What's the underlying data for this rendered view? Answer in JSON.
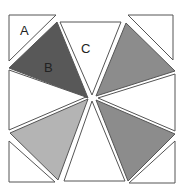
{
  "diagram": {
    "labels": {
      "a": "A",
      "b": "B",
      "c": "C"
    },
    "colors": {
      "stroke": "#555555",
      "white": "#ffffff",
      "dark_gray": "#585858",
      "medium_gray": "#8c8c8c",
      "light_gray": "#b4b4b4"
    },
    "shapes": [
      {
        "id": "corner-top-left",
        "label": "A",
        "fill": "white",
        "points": "9,15 56,15 9,61"
      },
      {
        "id": "pinwheel-dark",
        "label": "B",
        "fill": "dark_gray",
        "points": "57,22 9,68 88,98"
      },
      {
        "id": "pinwheel-top-white",
        "label": "C",
        "fill": "white",
        "points": "60,22 121,22 92,95"
      },
      {
        "id": "pinwheel-top-right",
        "fill": "medium_gray",
        "points": "126,23 175,71 96,96"
      },
      {
        "id": "pinwheel-right-white",
        "fill": "white",
        "points": "175,74 175,131 98,98"
      },
      {
        "id": "pinwheel-lower-right",
        "fill": "medium_gray",
        "points": "175,134 128,181 96,100"
      },
      {
        "id": "pinwheel-bottom-white",
        "fill": "white",
        "points": "64,181 125,181 92,101"
      },
      {
        "id": "pinwheel-lower-left",
        "fill": "light_gray",
        "points": "10,133 88,99 58,180"
      },
      {
        "id": "pinwheel-left-white",
        "fill": "white",
        "points": "9,70 9,130 86,97"
      },
      {
        "id": "corner-top-right",
        "fill": "white",
        "points": "128,15 173,15 173,60"
      },
      {
        "id": "corner-bottom-left",
        "fill": "white",
        "points": "9,141 9,182 55,182"
      },
      {
        "id": "corner-bottom-right",
        "fill": "white",
        "points": "175,141 175,183 129,183"
      }
    ]
  }
}
